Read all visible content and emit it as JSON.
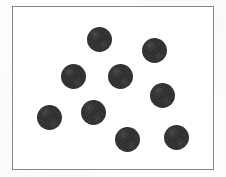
{
  "figure": {
    "canvas": {
      "width": 226,
      "height": 177
    },
    "page_background_color": "#fdfdfd"
  },
  "frame": {
    "name": "rectangular-border",
    "x": 12,
    "y": 6,
    "width": 202,
    "height": 164,
    "border_width": 1,
    "border_color": "#858585",
    "fill_color": "#ffffff"
  },
  "chart_data": {
    "type": "scatter",
    "title": "",
    "xlabel": "",
    "ylabel": "",
    "grid": false,
    "legend": null,
    "marker": {
      "shape": "circle",
      "filled": true,
      "diameter": 24,
      "color": "#2b2b2b"
    },
    "count": 9,
    "xlim": [
      12,
      214
    ],
    "ylim": [
      6,
      170
    ],
    "x": [
      99,
      154,
      73,
      120,
      162,
      49,
      93,
      127,
      176
    ],
    "y": [
      39,
      50,
      76,
      76,
      95,
      117,
      112,
      139,
      137
    ],
    "points": [
      {
        "label": "dot-1",
        "x": 99,
        "y": 39,
        "d": 25
      },
      {
        "label": "dot-2",
        "x": 154,
        "y": 50,
        "d": 25
      },
      {
        "label": "dot-3",
        "x": 73,
        "y": 76,
        "d": 25
      },
      {
        "label": "dot-4",
        "x": 120,
        "y": 76,
        "d": 25
      },
      {
        "label": "dot-5",
        "x": 162,
        "y": 95,
        "d": 25
      },
      {
        "label": "dot-6",
        "x": 49,
        "y": 117,
        "d": 25
      },
      {
        "label": "dot-7",
        "x": 93,
        "y": 112,
        "d": 25
      },
      {
        "label": "dot-8",
        "x": 127,
        "y": 139,
        "d": 25
      },
      {
        "label": "dot-9",
        "x": 176,
        "y": 137,
        "d": 25
      }
    ]
  }
}
